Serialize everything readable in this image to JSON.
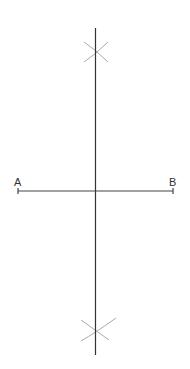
{
  "diagram": {
    "points": {
      "A": {
        "label": "A",
        "x": 18,
        "y": 191
      },
      "B": {
        "label": "B",
        "x": 173,
        "y": 191
      }
    },
    "segment_AB": {
      "x1": 18,
      "y1": 191,
      "x2": 173,
      "y2": 191,
      "color": "#444444"
    },
    "bisector": {
      "x1": 95.5,
      "y1": 28,
      "x2": 95.5,
      "y2": 355,
      "color": "#333333"
    },
    "arc_intersections": {
      "top": {
        "x": 96,
        "y": 52
      },
      "bottom": {
        "x": 95,
        "y": 331
      }
    },
    "arc_color": "#aaaaaa",
    "background": "#ffffff"
  }
}
